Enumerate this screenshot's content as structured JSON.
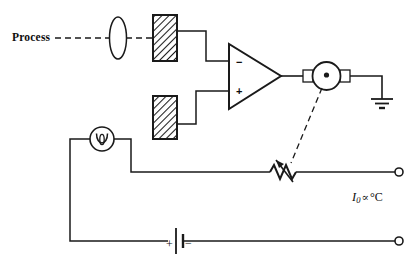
{
  "figure": {
    "kind": "schematic-circuit-diagram",
    "width": 418,
    "height": 263,
    "background_color": "#ffffff",
    "line_color": "#1a1a1a"
  },
  "labels": {
    "process": "Process",
    "output_current": {
      "symbol": "I",
      "subscript": "0",
      "proportional": "∝",
      "units": "°C",
      "full_text": "I0 ∝ °C"
    },
    "battery_plus": "+",
    "battery_minus": "−",
    "opamp_inverting": "−",
    "opamp_noninverting": "+"
  },
  "components": [
    {
      "id": "process-beam",
      "name": "process-dashed-beam",
      "type": "dashed-optical-path",
      "label": "Process"
    },
    {
      "id": "lens",
      "name": "lens-ellipse",
      "type": "lens",
      "shape": "narrow-vertical-ellipse"
    },
    {
      "id": "detector-top",
      "name": "photodetector-signal",
      "type": "hatched-block",
      "hatching": "diagonal"
    },
    {
      "id": "detector-bottom",
      "name": "photodetector-reference",
      "type": "hatched-block",
      "hatching": "diagonal"
    },
    {
      "id": "opamp",
      "name": "operational-amplifier",
      "type": "triangle",
      "inputs": [
        "−",
        "+"
      ]
    },
    {
      "id": "meter",
      "name": "meter-galvanometer",
      "type": "circle-with-terminals",
      "has_center_dot": true
    },
    {
      "id": "ground",
      "name": "ground-symbol",
      "type": "earth-ground",
      "bars": 3
    },
    {
      "id": "lamp",
      "name": "lamp-source",
      "type": "circle-with-loop"
    },
    {
      "id": "battery",
      "name": "battery-cell",
      "type": "single-cell",
      "polarity": [
        "+",
        "−"
      ]
    },
    {
      "id": "potentiometer",
      "name": "variable-resistor",
      "type": "zigzag-resistor-with-arrow",
      "zigzag_peaks": 4
    },
    {
      "id": "terminal-top",
      "name": "output-terminal-top",
      "type": "open-circle-terminal"
    },
    {
      "id": "terminal-bottom",
      "name": "output-terminal-bottom",
      "type": "open-circle-terminal"
    },
    {
      "id": "feedback-link",
      "name": "mechanical-linkage-dashed",
      "type": "dashed-line",
      "from": "meter",
      "to": "potentiometer"
    }
  ]
}
